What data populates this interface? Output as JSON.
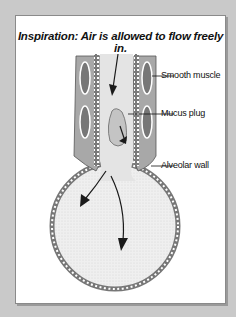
{
  "diagram": {
    "title": "Inspiration: Air is allowed to flow freely in.",
    "labels": {
      "smooth_muscle": "Smooth muscle",
      "mucus_plug": "Mucus plug",
      "alveolar_wall": "Alveolar wall"
    },
    "colors": {
      "background": "#c9c9c9",
      "panel": "#ffffff",
      "tissue": "#9a9a9a",
      "airway_fill": "#e8e8e8",
      "arrow": "#1a1a1a"
    }
  }
}
